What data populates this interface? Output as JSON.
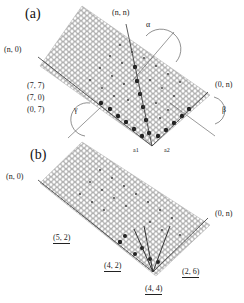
{
  "figure": {
    "panel_a": {
      "label": "(a)",
      "axis_labels": {
        "armchair": "(n, n)",
        "zigzag_left": "(n, 0)",
        "zigzag_right": "(0, n)"
      },
      "tube_indices": [
        "(7, 7)",
        "(7, 0)",
        "(0, 7)"
      ],
      "angles": {
        "alpha": "α",
        "beta": "β",
        "gamma": "γ"
      },
      "lattice_vectors": [
        "a1",
        "a2"
      ]
    },
    "panel_b": {
      "label": "(b)",
      "axis_labels": {
        "zigzag_left": "(n, 0)",
        "zigzag_right": "(0, n)"
      },
      "tube_indices": [
        "(5, 2)",
        "(4, 2)",
        "(4, 4)",
        "(2, 6)"
      ]
    },
    "colors": {
      "lattice": "#9a9a9a",
      "line": "#333333",
      "dot": "#222222",
      "background": "#ffffff"
    }
  }
}
